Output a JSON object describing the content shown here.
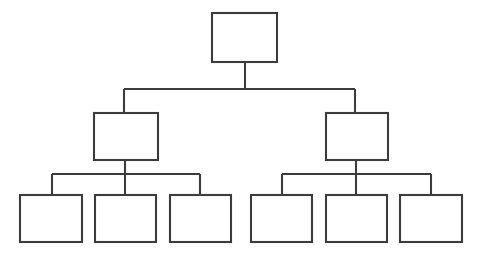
{
  "diagram": {
    "type": "tree",
    "title": "",
    "orientation": "top-down",
    "levels": 3,
    "node_count": 9,
    "background_color": "#ffffff",
    "line_color": "#3c3c3c",
    "line_width": 2,
    "box_fill": "#ffffff",
    "nodes": [
      {
        "id": "root",
        "label": "",
        "level": 0,
        "x": 212,
        "y": 13,
        "w": 65,
        "h": 49
      },
      {
        "id": "mid-1",
        "label": "",
        "level": 1,
        "x": 94,
        "y": 113,
        "w": 64,
        "h": 47
      },
      {
        "id": "mid-2",
        "label": "",
        "level": 1,
        "x": 326,
        "y": 113,
        "w": 62,
        "h": 47
      },
      {
        "id": "leaf-1",
        "label": "",
        "level": 2,
        "x": 20,
        "y": 195,
        "w": 62,
        "h": 47
      },
      {
        "id": "leaf-2",
        "label": "",
        "level": 2,
        "x": 95,
        "y": 195,
        "w": 61,
        "h": 47
      },
      {
        "id": "leaf-3",
        "label": "",
        "level": 2,
        "x": 170,
        "y": 195,
        "w": 61,
        "h": 47
      },
      {
        "id": "leaf-4",
        "label": "",
        "level": 2,
        "x": 251,
        "y": 195,
        "w": 61,
        "h": 47
      },
      {
        "id": "leaf-5",
        "label": "",
        "level": 2,
        "x": 326,
        "y": 195,
        "w": 61,
        "h": 47
      },
      {
        "id": "leaf-6",
        "label": "",
        "level": 2,
        "x": 400,
        "y": 195,
        "w": 62,
        "h": 47
      }
    ],
    "edges": [
      {
        "from": "root",
        "to": "mid-1"
      },
      {
        "from": "root",
        "to": "mid-2"
      },
      {
        "from": "mid-1",
        "to": "leaf-1"
      },
      {
        "from": "mid-1",
        "to": "leaf-2"
      },
      {
        "from": "mid-1",
        "to": "leaf-3"
      },
      {
        "from": "mid-2",
        "to": "leaf-4"
      },
      {
        "from": "mid-2",
        "to": "leaf-5"
      },
      {
        "from": "mid-2",
        "to": "leaf-6"
      }
    ],
    "connector_paths": {
      "root_stem": "M 245 62 L 245 89",
      "level1_bus": "M 124 89 L 355 89",
      "level1_drop_left": "M 124 89 L 124 113",
      "level1_drop_right": "M 355 89 L 355 113",
      "mid1_stem": "M 125 160 L 125 174",
      "left_bus": "M 52 174 L 200 174",
      "left_drop_1": "M 52 174 L 52 195",
      "left_drop_2": "M 125 174 L 125 195",
      "left_drop_3": "M 200 174 L 200 195",
      "mid2_stem": "M 356 160 L 356 174",
      "right_bus": "M 282 174 L 431 174",
      "right_drop_1": "M 282 174 L 282 195",
      "right_drop_2": "M 356 174 L 356 195",
      "right_drop_3": "M 431 174 L 431 195"
    }
  }
}
